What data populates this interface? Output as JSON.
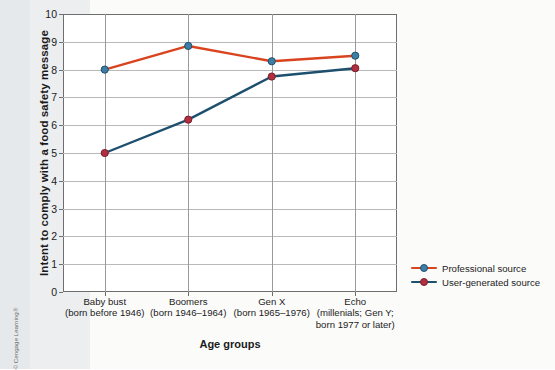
{
  "chart_data": {
    "type": "line",
    "title": "",
    "xlabel": "Age groups",
    "ylabel": "Intent to comply with a food safety message",
    "ylim": [
      0,
      10
    ],
    "ytick_step": 1,
    "grid": true,
    "legend_position": "right",
    "categories": [
      "Baby bust",
      "Boomers",
      "Gen X",
      "Echo"
    ],
    "category_sublabels": [
      [
        "(born before 1946)"
      ],
      [
        "(born 1946–1964)"
      ],
      [
        "(born 1965–1976)"
      ],
      [
        "(millenials; Gen Y;",
        "born 1977 or later)"
      ]
    ],
    "yticks": [
      "0",
      "1",
      "2",
      "3",
      "4",
      "5",
      "6",
      "7",
      "8",
      "9",
      "10"
    ],
    "series": [
      {
        "name": "Professional source",
        "values": [
          8.0,
          8.85,
          8.3,
          8.5
        ],
        "line_color": "#d9441f",
        "marker_color": "#3d7ea6",
        "marker_edge": "#1f4f6b"
      },
      {
        "name": "User-generated source",
        "values": [
          5.0,
          6.2,
          7.75,
          8.05
        ],
        "line_color": "#1d4f6e",
        "marker_color": "#b03040",
        "marker_edge": "#7a1f2c"
      }
    ]
  },
  "legend": {
    "items": [
      {
        "label": "Professional source"
      },
      {
        "label": "User-generated source"
      }
    ]
  },
  "axis": {
    "x_title": "Age groups",
    "y_title": "Intent to comply with a food safety message"
  },
  "credit": {
    "text": "© Cengage Learning®"
  },
  "colors": {
    "professional_line": "#d9441f",
    "usergenerated_line": "#1d4f6e",
    "axis": "#6e6e6e",
    "grid": "#b9b9b9",
    "text": "#1b1b1b"
  }
}
